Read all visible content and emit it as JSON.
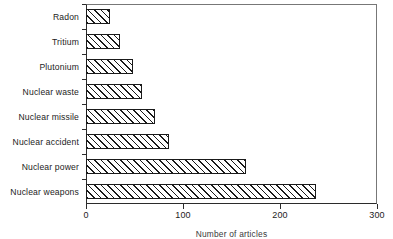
{
  "chart_data": {
    "type": "bar",
    "orientation": "horizontal",
    "title": "",
    "xlabel": "Number of articles",
    "ylabel": "",
    "xlim": [
      0,
      300
    ],
    "xticks": [
      0,
      100,
      200,
      300
    ],
    "xticklabels": [
      "0",
      "100",
      "200",
      "300"
    ],
    "grid": false,
    "legend": null,
    "categories": [
      "Radon",
      "Tritium",
      "Plutonium",
      "Nuclear waste",
      "Nuclear missile",
      "Nuclear accident",
      "Nuclear power",
      "Nuclear weapons"
    ],
    "values": [
      25,
      35,
      48,
      58,
      71,
      86,
      165,
      237
    ],
    "bar_style": {
      "fill": "#ffffff",
      "edge": "#1a1a1a",
      "hatch": "/"
    }
  },
  "axis": {
    "x_tick_labels": [
      "0",
      "100",
      "200",
      "300"
    ],
    "x_title": "Number of articles"
  },
  "categories": {
    "items": [
      {
        "label": "Radon",
        "value": 25
      },
      {
        "label": "Tritium",
        "value": 35
      },
      {
        "label": "Plutonium",
        "value": 48
      },
      {
        "label": "Nuclear waste",
        "value": 58
      },
      {
        "label": "Nuclear missile",
        "value": 71
      },
      {
        "label": "Nuclear accident",
        "value": 86
      },
      {
        "label": "Nuclear power",
        "value": 165
      },
      {
        "label": "Nuclear weapons",
        "value": 237
      }
    ]
  },
  "colors": {
    "axis": "#2b2b2b",
    "bar_edge": "#1a1a1a",
    "bar_fill": "#ffffff",
    "text": "#1c1c1c"
  }
}
